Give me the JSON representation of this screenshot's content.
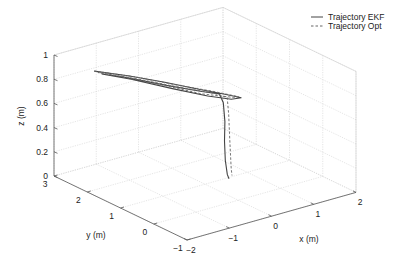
{
  "chart_data": {
    "type": "line3d",
    "title": "",
    "xlabel": "x (m)",
    "ylabel": "y (m)",
    "zlabel": "z (m)",
    "xlim": [
      -2,
      2
    ],
    "ylim": [
      -1,
      3
    ],
    "zlim": [
      0,
      1
    ],
    "xticks": [
      -2,
      -1,
      0,
      1,
      2
    ],
    "yticks": [
      -1,
      0,
      1,
      2,
      3
    ],
    "zticks": [
      0,
      0.2,
      0.4,
      0.6,
      0.8,
      1
    ],
    "grid": true,
    "legend_position": "top-right",
    "series": [
      {
        "name": "Trajectory EKF",
        "style": "solid",
        "color": "#444444",
        "points": [
          [
            -1.6,
            2.3,
            0.92
          ],
          [
            -1.0,
            2.0,
            0.86
          ],
          [
            -0.4,
            1.7,
            0.79
          ],
          [
            0.2,
            1.4,
            0.71
          ],
          [
            0.6,
            1.2,
            0.66
          ],
          [
            0.9,
            1.05,
            0.62
          ],
          [
            0.7,
            1.1,
            0.62
          ],
          [
            0.3,
            1.3,
            0.66
          ],
          [
            -0.3,
            1.6,
            0.74
          ],
          [
            -1.0,
            1.95,
            0.84
          ],
          [
            -1.5,
            2.2,
            0.9
          ],
          [
            -1.1,
            2.0,
            0.86
          ],
          [
            -0.4,
            1.65,
            0.77
          ],
          [
            0.2,
            1.35,
            0.7
          ],
          [
            0.5,
            1.2,
            0.67
          ],
          [
            0.55,
            1.15,
            0.6
          ],
          [
            0.55,
            1.1,
            0.45
          ],
          [
            0.5,
            1.05,
            0.3
          ],
          [
            0.48,
            1.0,
            0.15
          ],
          [
            0.45,
            0.9,
            0.05
          ],
          [
            0.45,
            0.85,
            0.02
          ]
        ]
      },
      {
        "name": "Trajectory Opt",
        "style": "dashed",
        "color": "#666666",
        "points": [
          [
            -1.6,
            2.3,
            0.92
          ],
          [
            -0.9,
            1.95,
            0.85
          ],
          [
            -0.2,
            1.6,
            0.76
          ],
          [
            0.4,
            1.3,
            0.69
          ],
          [
            0.85,
            1.07,
            0.63
          ],
          [
            0.75,
            1.1,
            0.63
          ],
          [
            0.2,
            1.35,
            0.68
          ],
          [
            -0.5,
            1.7,
            0.78
          ],
          [
            -1.2,
            2.05,
            0.87
          ],
          [
            -1.55,
            2.25,
            0.91
          ],
          [
            -0.9,
            1.9,
            0.84
          ],
          [
            -0.2,
            1.55,
            0.75
          ],
          [
            0.4,
            1.25,
            0.68
          ],
          [
            0.62,
            1.12,
            0.64
          ],
          [
            0.64,
            1.1,
            0.5
          ],
          [
            0.62,
            1.05,
            0.35
          ],
          [
            0.6,
            1.0,
            0.2
          ],
          [
            0.58,
            0.95,
            0.08
          ],
          [
            0.56,
            0.9,
            0.03
          ]
        ]
      }
    ]
  },
  "legend": {
    "items": [
      {
        "label": "Trajectory EKF",
        "style": "solid"
      },
      {
        "label": "Trajectory Opt",
        "style": "dashed"
      }
    ]
  },
  "axes_labels": {
    "x": "x (m)",
    "y": "y (m)",
    "z": "z (m)"
  },
  "tick_labels": {
    "x": [
      "−2",
      "−1",
      "0",
      "1",
      "2"
    ],
    "y": [
      "−1",
      "0",
      "1",
      "2",
      "3"
    ],
    "z": [
      "0",
      "0.2",
      "0.4",
      "0.6",
      "0.8",
      "1"
    ]
  }
}
